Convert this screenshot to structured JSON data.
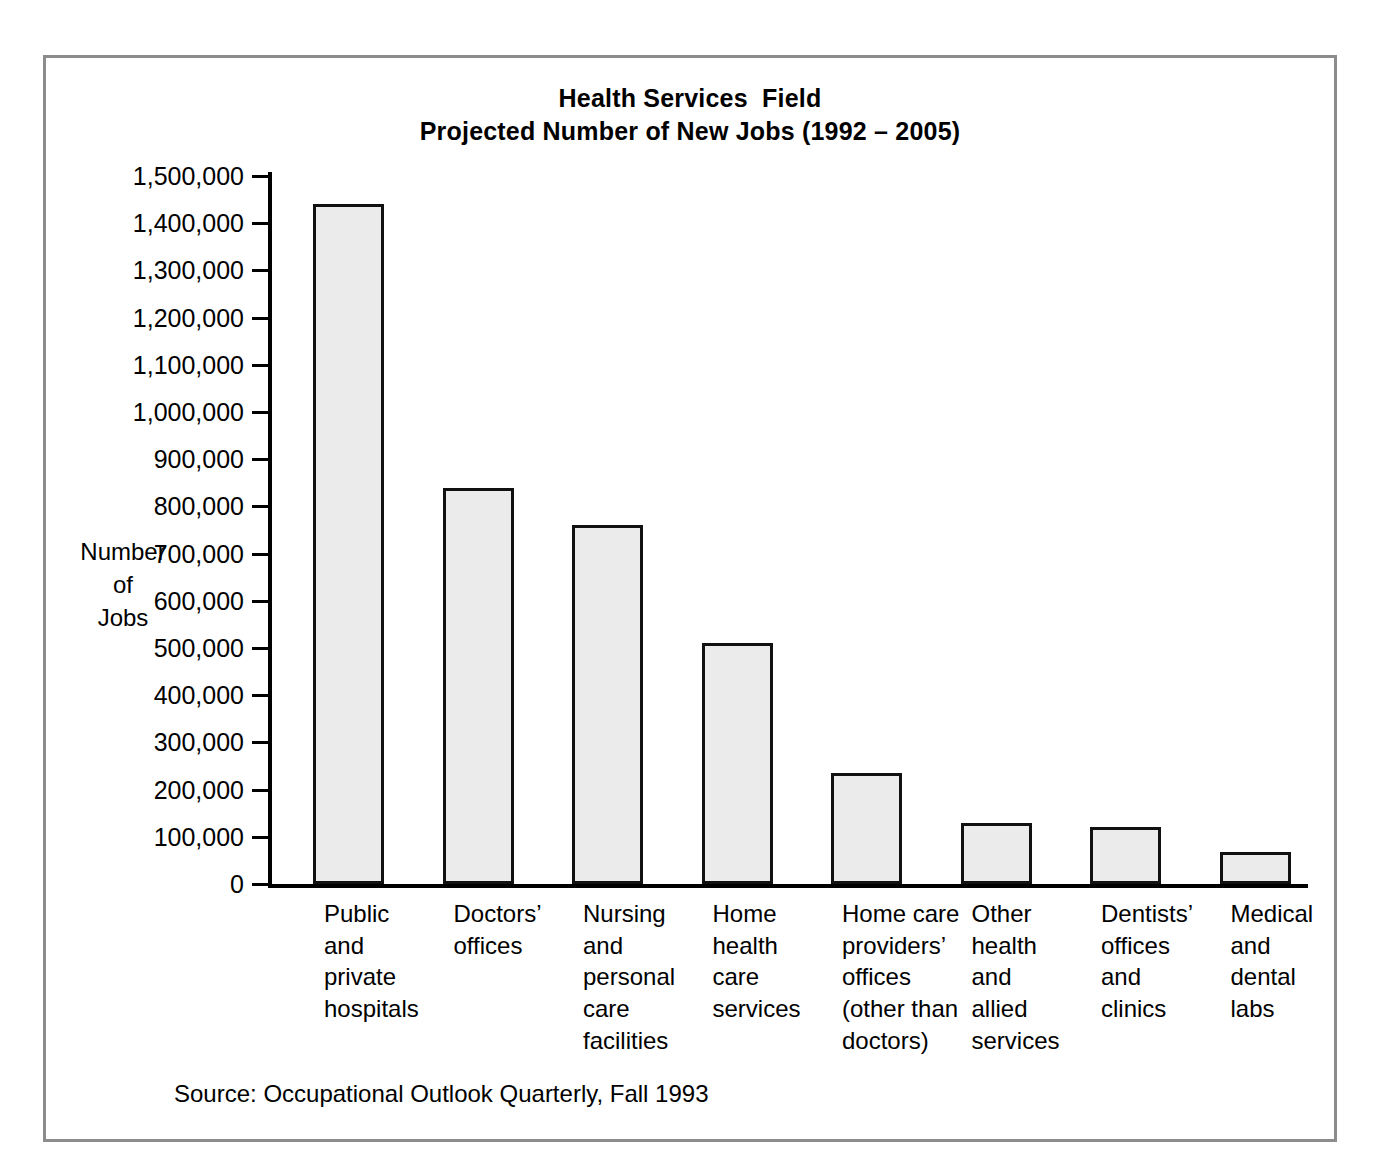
{
  "figure": {
    "title_line1": "Health Services  Field",
    "title_line2": "Projected Number of New Jobs (1992 – 2005)",
    "source": "Source: Occupational Outlook Quarterly, Fall 1993",
    "frame_color": "#8c8c8c",
    "bar_fill_color": "#ebebeb",
    "bar_edge_color": "#111111"
  },
  "chart_data": {
    "type": "bar",
    "title": "Health Services  Field\nProjected Number of New Jobs (1992 – 2005)",
    "xlabel": "",
    "ylabel": "Number\nof\nJobs",
    "ylim": [
      0,
      1500000
    ],
    "ytick_step": 100000,
    "grid": false,
    "legend": "none",
    "categories": [
      "Public\nand\nprivate\nhospitals",
      "Doctors’\noffices",
      "Nursing\nand\npersonal\ncare\nfacilities",
      "Home\nhealth\ncare\nservices",
      "Home care\nproviders’\noffices\n(other than\ndoctors)",
      "Other\nhealth\nand\nallied\nservices",
      "Dentists’\noffices\nand\nclinics",
      "Medical\nand\ndental\nlabs"
    ],
    "values": [
      1440000,
      840000,
      760000,
      510000,
      235000,
      130000,
      120000,
      68000
    ],
    "ytick_labels": [
      "1,500,000",
      "1,400,000",
      "1,300,000",
      "1,200,000",
      "1,100,000",
      "1,000,000",
      "900,000",
      "800,000",
      "700,000",
      "600,000",
      "500,000",
      "400,000",
      "300,000",
      "200,000",
      "100,000",
      "0"
    ],
    "ytick_values": [
      1500000,
      1400000,
      1300000,
      1200000,
      1100000,
      1000000,
      900000,
      800000,
      700000,
      600000,
      500000,
      400000,
      300000,
      200000,
      100000,
      0
    ]
  }
}
